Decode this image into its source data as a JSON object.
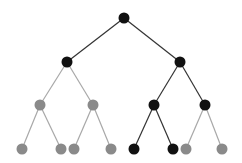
{
  "diagram": {
    "type": "binary-tree",
    "colors": {
      "active": "#111111",
      "inactive": "#8a8a8a",
      "edge_active": "#333333",
      "edge_inactive": "#a8a8a8"
    },
    "node_radius": 5.5,
    "nodes": [
      {
        "id": "n0",
        "x": 124,
        "y": 18,
        "state": "active"
      },
      {
        "id": "n1",
        "x": 67,
        "y": 62,
        "state": "active"
      },
      {
        "id": "n2",
        "x": 180,
        "y": 62,
        "state": "active"
      },
      {
        "id": "n3",
        "x": 40,
        "y": 105,
        "state": "inactive"
      },
      {
        "id": "n4",
        "x": 93,
        "y": 105,
        "state": "inactive"
      },
      {
        "id": "n5",
        "x": 154,
        "y": 105,
        "state": "active"
      },
      {
        "id": "n6",
        "x": 205,
        "y": 105,
        "state": "active"
      },
      {
        "id": "n7",
        "x": 22,
        "y": 149,
        "state": "inactive"
      },
      {
        "id": "n8",
        "x": 61,
        "y": 149,
        "state": "inactive"
      },
      {
        "id": "n9",
        "x": 74,
        "y": 149,
        "state": "inactive"
      },
      {
        "id": "n10",
        "x": 111,
        "y": 149,
        "state": "inactive"
      },
      {
        "id": "n11",
        "x": 134,
        "y": 149,
        "state": "active"
      },
      {
        "id": "n12",
        "x": 173,
        "y": 149,
        "state": "active"
      },
      {
        "id": "n13",
        "x": 186,
        "y": 149,
        "state": "inactive"
      },
      {
        "id": "n14",
        "x": 222,
        "y": 149,
        "state": "inactive"
      }
    ],
    "edges": [
      [
        "n0",
        "n1",
        "active"
      ],
      [
        "n0",
        "n2",
        "active"
      ],
      [
        "n1",
        "n3",
        "inactive"
      ],
      [
        "n1",
        "n4",
        "inactive"
      ],
      [
        "n2",
        "n5",
        "active"
      ],
      [
        "n2",
        "n6",
        "active"
      ],
      [
        "n3",
        "n7",
        "inactive"
      ],
      [
        "n3",
        "n8",
        "inactive"
      ],
      [
        "n4",
        "n9",
        "inactive"
      ],
      [
        "n4",
        "n10",
        "inactive"
      ],
      [
        "n5",
        "n11",
        "active"
      ],
      [
        "n5",
        "n12",
        "active"
      ],
      [
        "n6",
        "n13",
        "inactive"
      ],
      [
        "n6",
        "n14",
        "inactive"
      ]
    ]
  }
}
